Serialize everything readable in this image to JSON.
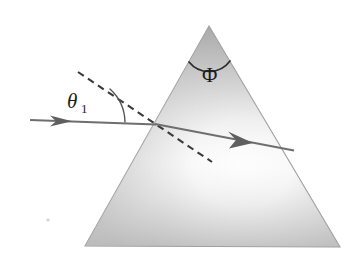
{
  "figure": {
    "background_color": "#ffffff",
    "width": 359,
    "height": 259
  },
  "prism": {
    "name": "triangular-prism",
    "apex": {
      "x": 209,
      "y": 26
    },
    "bottom_left": {
      "x": 85,
      "y": 246
    },
    "bottom_right": {
      "x": 340,
      "y": 247
    },
    "fill_light": "#fdfdfd",
    "fill_mid": "#d2d2d2",
    "fill_dark": "#b0b0b0",
    "edge_color": "#9a9a9a"
  },
  "rays": {
    "incident": {
      "name": "incident-ray",
      "label": "incident ray",
      "start": {
        "x": 30,
        "y": 120
      },
      "end": {
        "x": 155,
        "y": 124
      },
      "arrow_at": {
        "x": 68,
        "y": 121
      },
      "color": "#6e6e6e"
    },
    "refracted": {
      "name": "refracted-ray",
      "label": "refracted ray",
      "start": {
        "x": 155,
        "y": 124
      },
      "end": {
        "x": 293,
        "y": 150
      },
      "arrow_at": {
        "x": 250,
        "y": 142
      },
      "color": "#6e6e6e"
    },
    "normal": {
      "name": "normal-dashed-line",
      "label": "surface normal",
      "start": {
        "x": 78,
        "y": 72
      },
      "end": {
        "x": 212,
        "y": 162
      },
      "color": "#3a3a3a",
      "dash": "7 5"
    }
  },
  "angles": {
    "incidence": {
      "name": "angle-theta1",
      "symbol": "θ",
      "subscript": "1",
      "label_position": {
        "x": 70,
        "y": 108
      },
      "arc_color": "#555555"
    },
    "apex": {
      "name": "angle-phi",
      "symbol": "Φ",
      "label_position": {
        "x": 203,
        "y": 82
      },
      "arc_color": "#2a2a2a"
    }
  },
  "artifacts": {
    "speck": {
      "name": "scan-speck",
      "x": 48,
      "y": 220,
      "color": "#cfcfcf"
    }
  }
}
